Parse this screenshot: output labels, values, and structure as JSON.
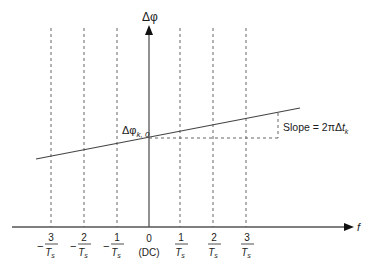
{
  "diagram": {
    "y_axis_label": "Δφ",
    "x_axis_label": "f",
    "intercept_label": {
      "main": "Δφ",
      "sub": "k, 0"
    },
    "slope_label": {
      "prefix": "Slope = 2πΔ",
      "var": "t",
      "sub": "k"
    },
    "ticks": [
      {
        "sign": "−",
        "num": "3",
        "den": "T",
        "den_sub": "s"
      },
      {
        "sign": "−",
        "num": "2",
        "den": "T",
        "den_sub": "s"
      },
      {
        "sign": "−",
        "num": "1",
        "den": "T",
        "den_sub": "s"
      },
      {
        "sign": "",
        "num": "0",
        "den": "(DC)",
        "den_sub": ""
      },
      {
        "sign": "",
        "num": "1",
        "den": "T",
        "den_sub": "s"
      },
      {
        "sign": "",
        "num": "2",
        "den": "T",
        "den_sub": "s"
      },
      {
        "sign": "",
        "num": "3",
        "den": "T",
        "den_sub": "s"
      }
    ],
    "colors": {
      "line": "#555555",
      "dashed": "#666666",
      "text": "#1a1a1a"
    }
  }
}
